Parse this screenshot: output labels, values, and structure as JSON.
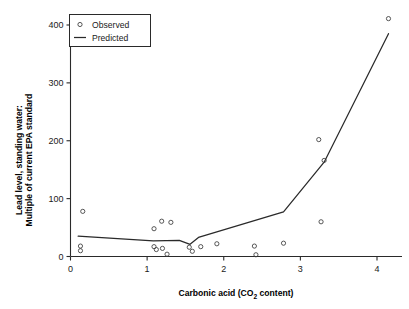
{
  "chart_data": {
    "type": "scatter",
    "title": "",
    "xlabel": "Carbonic acid (CO2 content)",
    "xlabel_parts": {
      "pre": "Carbonic acid (CO",
      "sub": "2",
      "post": " content)"
    },
    "ylabel_line1": "Lead level, standing water:",
    "ylabel_line2": "Multiple of current EPA standard",
    "xlim": [
      0.0,
      4.35
    ],
    "ylim": [
      0,
      425
    ],
    "xticks": [
      0,
      1,
      2,
      3,
      4
    ],
    "xticklabels": [
      "0",
      "1",
      "2",
      "3",
      "4"
    ],
    "yticks": [
      0,
      100,
      200,
      300,
      400
    ],
    "yticklabels": [
      "0",
      "100",
      "200",
      "300",
      "400"
    ],
    "grid": false,
    "legend_position": "top-left",
    "series": [
      {
        "name": "Observed",
        "type": "scatter",
        "marker": "open-circle",
        "color": "#3a3a3a",
        "points": [
          {
            "x": 0.13,
            "y": 18
          },
          {
            "x": 0.13,
            "y": 10
          },
          {
            "x": 0.16,
            "y": 78
          },
          {
            "x": 1.09,
            "y": 48
          },
          {
            "x": 1.09,
            "y": 17
          },
          {
            "x": 1.12,
            "y": 12
          },
          {
            "x": 1.19,
            "y": 61
          },
          {
            "x": 1.2,
            "y": 14
          },
          {
            "x": 1.26,
            "y": 4
          },
          {
            "x": 1.31,
            "y": 59
          },
          {
            "x": 1.55,
            "y": 16
          },
          {
            "x": 1.59,
            "y": 9
          },
          {
            "x": 1.7,
            "y": 17
          },
          {
            "x": 1.91,
            "y": 22
          },
          {
            "x": 2.4,
            "y": 18
          },
          {
            "x": 2.42,
            "y": 3
          },
          {
            "x": 2.78,
            "y": 23
          },
          {
            "x": 3.24,
            "y": 202
          },
          {
            "x": 3.27,
            "y": 60
          },
          {
            "x": 3.31,
            "y": 166
          },
          {
            "x": 4.15,
            "y": 411
          }
        ]
      },
      {
        "name": "Predicted",
        "type": "line",
        "color": "#2a2a2a",
        "vertices": [
          {
            "x": 0.1,
            "y": 35
          },
          {
            "x": 1.08,
            "y": 27
          },
          {
            "x": 1.42,
            "y": 28
          },
          {
            "x": 1.56,
            "y": 21
          },
          {
            "x": 1.67,
            "y": 33
          },
          {
            "x": 2.78,
            "y": 77
          },
          {
            "x": 3.31,
            "y": 163
          },
          {
            "x": 4.15,
            "y": 385
          }
        ]
      }
    ],
    "legend_entries": [
      {
        "label": "Observed",
        "marker": "open-circle"
      },
      {
        "label": "Predicted",
        "marker": "line"
      }
    ]
  }
}
